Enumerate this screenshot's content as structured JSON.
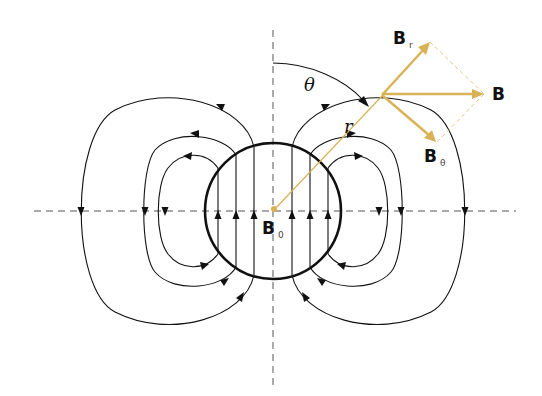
{
  "figure": {
    "labels": {
      "B0_main": "B",
      "B0_sub": "0",
      "B_main": "B",
      "Br_main": "B",
      "Br_sub": "r",
      "Btheta_main": "B",
      "Btheta_sub": "θ",
      "theta": "θ",
      "r": "r"
    },
    "colors": {
      "lines": "#111111",
      "vector_accent": "#d9b255",
      "axis": "#555555"
    },
    "components": {
      "interior_field_lines": 6,
      "exterior_loops_per_side": 3,
      "field_direction_inside": "up",
      "vectors": [
        "B_r",
        "B_theta",
        "B"
      ]
    }
  }
}
